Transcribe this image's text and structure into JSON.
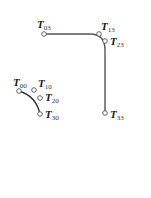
{
  "diagram": {
    "colors": {
      "curve": "#555555",
      "point_stroke": "#555555",
      "label": "#1a1a1a",
      "background": "#ffffff"
    },
    "curves": [
      {
        "name": "large-corner-curve",
        "from": "T03",
        "to": "T33"
      },
      {
        "name": "small-arc-curve",
        "from": "T00",
        "to": "T30"
      }
    ],
    "points": [
      {
        "id": "T03",
        "letter": "T",
        "sub": "03",
        "x": 44,
        "y": 34
      },
      {
        "id": "T13",
        "letter": "T",
        "sub": "13",
        "x": 99,
        "y": 34
      },
      {
        "id": "T23",
        "letter": "T",
        "sub": "23",
        "x": 105,
        "y": 41
      },
      {
        "id": "T33",
        "letter": "T",
        "sub": "33",
        "x": 105,
        "y": 113
      },
      {
        "id": "T00",
        "letter": "T",
        "sub": "00",
        "x": 19,
        "y": 91
      },
      {
        "id": "T10",
        "letter": "T",
        "sub": "10",
        "x": 34,
        "y": 90
      },
      {
        "id": "T20",
        "letter": "T",
        "sub": "20",
        "x": 40,
        "y": 98
      },
      {
        "id": "T30",
        "letter": "T",
        "sub": "30",
        "x": 40,
        "y": 114
      }
    ]
  }
}
